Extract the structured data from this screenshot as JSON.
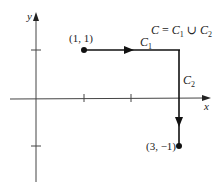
{
  "axes": {
    "x_label": "x",
    "y_label": "y",
    "x_ticks": [
      1,
      2,
      3
    ],
    "y_ticks": [
      1,
      -1
    ]
  },
  "curve": {
    "union_label_C": "C",
    "union_label_eq": " = ",
    "union_label_C1": "C",
    "union_label_C1_sub": "1",
    "union_label_cup": " ∪ ",
    "union_label_C2": "C",
    "union_label_C2_sub": "2",
    "segments": [
      {
        "name": "C",
        "sub": "1",
        "from": [
          1,
          1
        ],
        "to": [
          3,
          1
        ],
        "direction": "right"
      },
      {
        "name": "C",
        "sub": "2",
        "from": [
          3,
          1
        ],
        "to": [
          3,
          -1
        ],
        "direction": "down"
      }
    ]
  },
  "points": {
    "start_label": "(1, 1)",
    "end_label": "(3, −1)"
  },
  "colors": {
    "ink": "#222222",
    "background": "#ffffff"
  }
}
